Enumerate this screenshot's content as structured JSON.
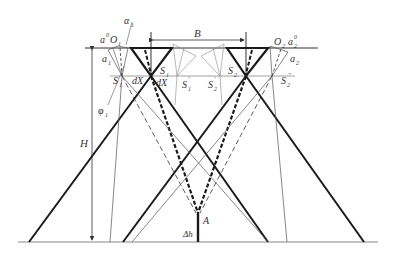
{
  "diagram": {
    "title": "",
    "labels": {
      "B": "B",
      "H": "H",
      "A": "A",
      "dh": "Δh",
      "O1": "O",
      "O1_sub": "1",
      "O2": "O",
      "O2_sub": "2",
      "a1": "a",
      "a1_sub": "1",
      "a1_0": "a",
      "a1_0_sup": "0",
      "a1_0_sub": "1",
      "alpha1": "α",
      "alpha1_sub": "1",
      "a2": "a",
      "a2_sub": "2",
      "a2_0": "a",
      "a2_0_sup": "0",
      "a2_0_sub": "2",
      "phi1": "φ",
      "phi1_sub": "1",
      "S1": "S",
      "S1_sub": "1",
      "S1_prime": "S",
      "S1_prime_sub": "1",
      "S1_prime_mark": "′",
      "S1_dprime": "S",
      "S1_dprime_sub": "1",
      "S1_dprime_mark": "″",
      "S2": "S",
      "S2_sub": "2",
      "S2_prime": "S",
      "S2_prime_sub": "2",
      "S2_prime_mark": "′",
      "S2_dprime": "S",
      "S2_dprime_sub": "2",
      "S2_dprime_mark": "″",
      "dX1": "dX",
      "dX2": "dX"
    },
    "colors": {
      "line": "#1a1a1a",
      "thin": "#555555",
      "ground": "#888888"
    }
  }
}
